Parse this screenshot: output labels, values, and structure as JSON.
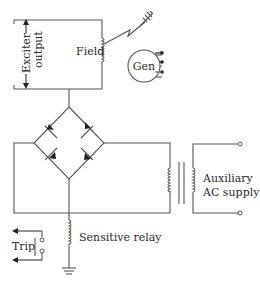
{
  "diagram": {
    "type": "circuit-schematic",
    "labels": {
      "exciter_output_line1": "Exciter",
      "exciter_output_line2": "output",
      "field": "Field",
      "generator": "Gen",
      "auxiliary_line1": "Auxiliary",
      "auxiliary_line2": "AC supply",
      "sensitive_relay": "Sensitive relay",
      "trip": "Trip"
    },
    "components": [
      {
        "id": "exciter-output",
        "kind": "dc-source-terminals"
      },
      {
        "id": "field-winding",
        "kind": "inductor"
      },
      {
        "id": "generator",
        "kind": "machine",
        "terminals": 3
      },
      {
        "id": "earth-fault-path",
        "kind": "ground-via-rotor"
      },
      {
        "id": "bridge-rectifier",
        "kind": "diode-bridge",
        "diodes": 4
      },
      {
        "id": "transformer",
        "kind": "transformer"
      },
      {
        "id": "auxiliary-ac-supply",
        "kind": "ac-source-terminals"
      },
      {
        "id": "sensitive-relay",
        "kind": "relay-coil"
      },
      {
        "id": "trip-contacts",
        "kind": "relay-contact"
      },
      {
        "id": "ground",
        "kind": "earth"
      }
    ],
    "colors": {
      "line": "#555555",
      "text": "#2a2a2a",
      "background": "#ffffff"
    }
  }
}
